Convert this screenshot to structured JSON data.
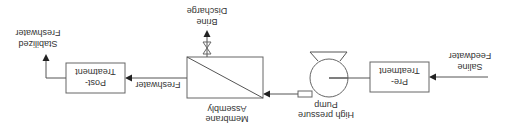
{
  "diagram": {
    "orientation": "rotated 180 degrees",
    "nodes": {
      "feed": {
        "line1": "Saline",
        "line2": "Feedwater"
      },
      "pretreatment": {
        "line1": "Pre-",
        "line2": "Treatment"
      },
      "pump": {
        "line1": "High pressure",
        "line2": "Pump"
      },
      "membrane": {
        "line1": "Membrane",
        "line2": "Assembly"
      },
      "brine": {
        "line1": "Brine",
        "line2": "Discharge"
      },
      "freshwater": {
        "label": "Freshwater"
      },
      "posttreatment": {
        "line1": "Post-",
        "line2": "Treatment"
      },
      "product": {
        "line1": "Stabilized",
        "line2": "Freshwater"
      }
    },
    "edges": [
      {
        "from": "feed",
        "to": "pretreatment"
      },
      {
        "from": "pretreatment",
        "to": "pump"
      },
      {
        "from": "pump",
        "to": "membrane"
      },
      {
        "from": "membrane",
        "to": "brine",
        "via": "valve"
      },
      {
        "from": "membrane",
        "to": "posttreatment",
        "label": "Freshwater"
      },
      {
        "from": "posttreatment",
        "to": "product"
      }
    ],
    "colors": {
      "line": "#555555",
      "box_border": "#666666",
      "text": "#333333",
      "background": "#ffffff"
    }
  }
}
